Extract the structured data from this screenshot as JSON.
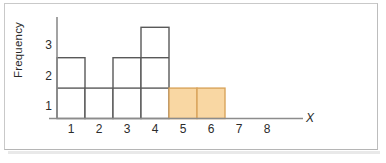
{
  "chart_data": {
    "type": "bar",
    "title": "",
    "subtitle": "",
    "xlabel": "X",
    "ylabel": "Frequency",
    "categories": [
      "1",
      "2",
      "3",
      "4",
      "5",
      "6",
      "7",
      "8"
    ],
    "values": [
      2,
      1,
      2,
      3,
      1,
      1,
      0,
      0
    ],
    "xtick_labels": [
      "1",
      "2",
      "3",
      "4",
      "5",
      "6",
      "7",
      "8"
    ],
    "ytick_labels": [
      "1",
      "2",
      "3"
    ],
    "xlim": [
      0.5,
      8.5
    ],
    "ylim": [
      0,
      3
    ],
    "grid": false,
    "legend": null,
    "bar_style": "unit-blocks",
    "highlighted_categories": [
      "5",
      "6"
    ],
    "annotations": [],
    "colors": {
      "bar_fill_default": "#ffffff",
      "bar_edge_default": "#595959",
      "bar_fill_highlight": "#f9d7a3",
      "bar_edge_highlight": "#d9a45c",
      "axis": "#8c8c8c",
      "text": "#2b2b2b",
      "frame_border": "#c9c9c9",
      "background": "#ffffff"
    }
  },
  "figure": {
    "y_axis_label": "Frequency",
    "x_axis_label": "X"
  }
}
